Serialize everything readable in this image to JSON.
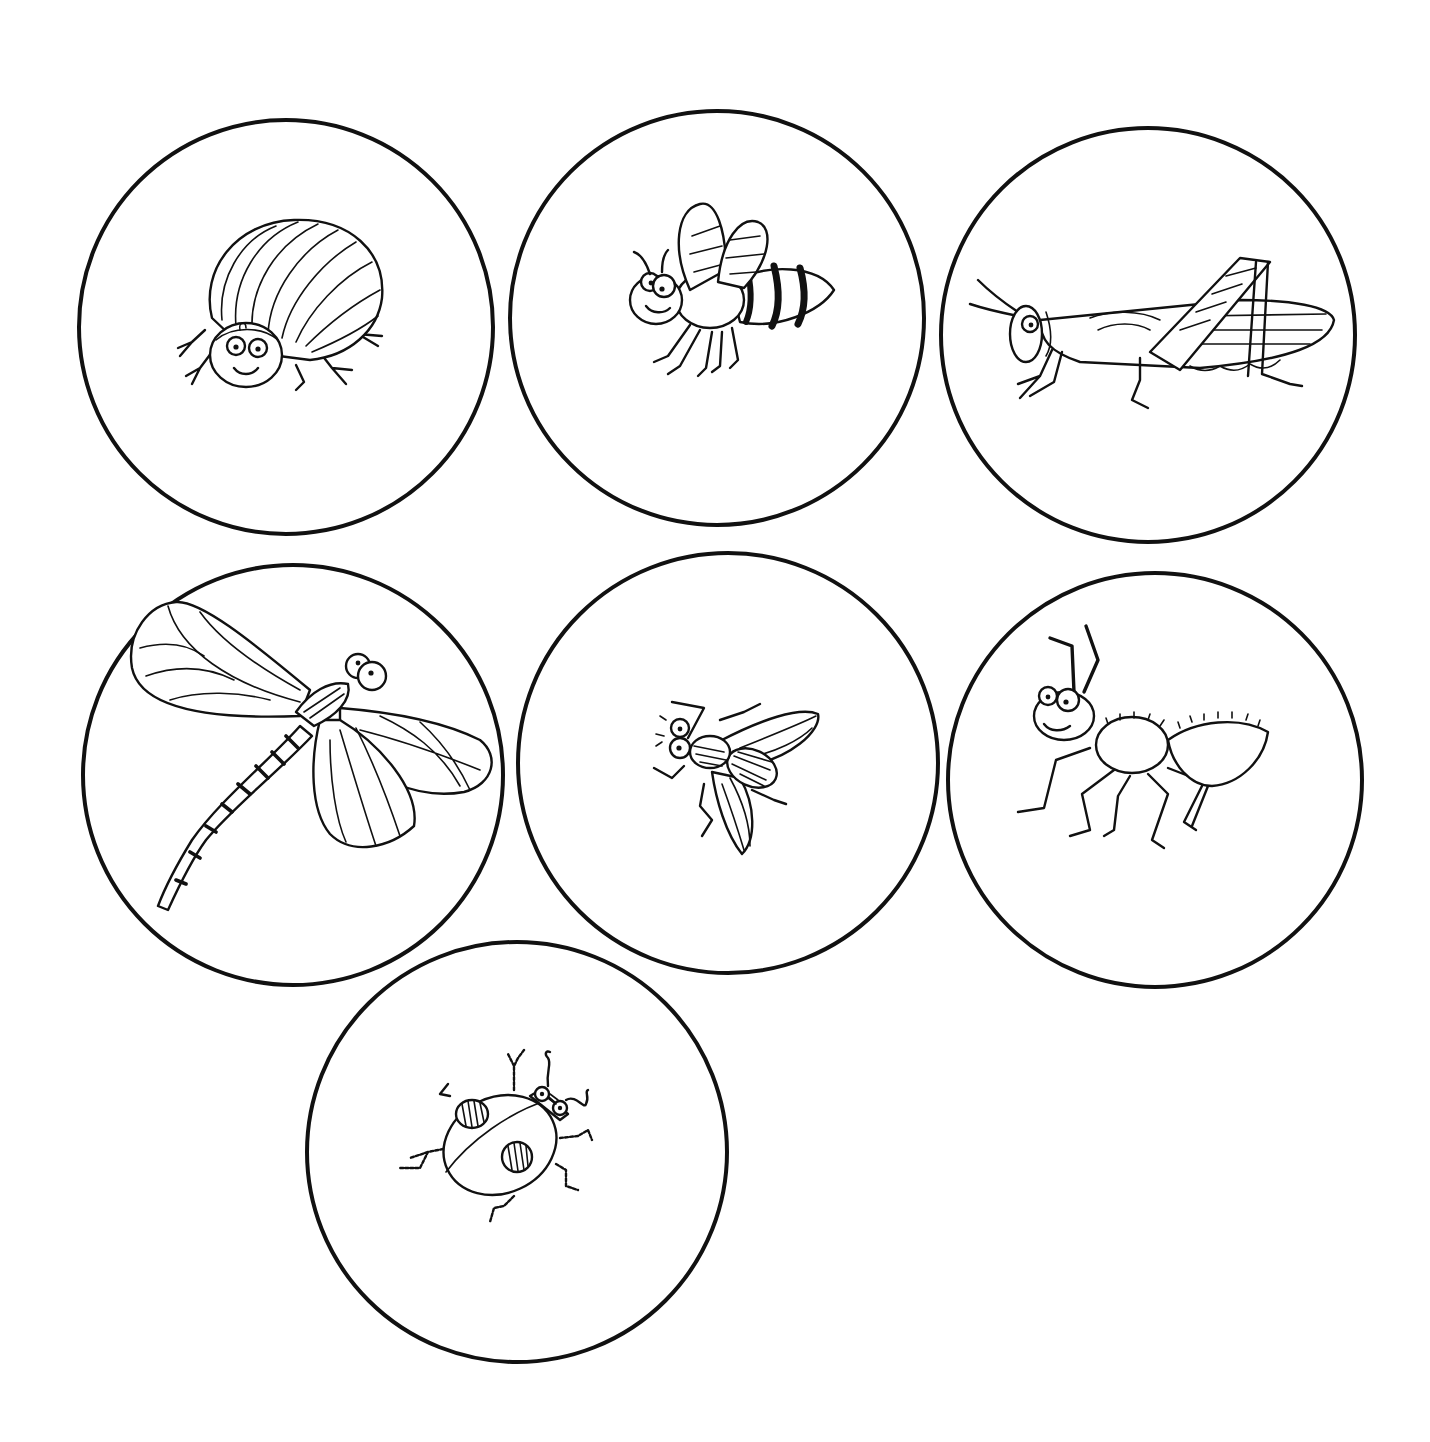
{
  "page": {
    "title": "",
    "background": "#ffffff",
    "line_color": "#111111"
  },
  "cards": [
    {
      "id": "beetle",
      "icon": "beetle-icon",
      "label": "beetle",
      "cx": 286,
      "cy": 327,
      "r": 207
    },
    {
      "id": "bee",
      "icon": "bee-icon",
      "label": "bee",
      "cx": 717,
      "cy": 318,
      "r": 207
    },
    {
      "id": "grasshopper",
      "icon": "grasshopper-icon",
      "label": "grasshopper",
      "cx": 1148,
      "cy": 335,
      "r": 207
    },
    {
      "id": "dragonfly",
      "icon": "dragonfly-icon",
      "label": "dragonfly",
      "cx": 293,
      "cy": 775,
      "r": 210
    },
    {
      "id": "fly",
      "icon": "fly-icon",
      "label": "fly",
      "cx": 728,
      "cy": 763,
      "r": 210
    },
    {
      "id": "ant",
      "icon": "ant-icon",
      "label": "ant",
      "cx": 1155,
      "cy": 780,
      "r": 207
    },
    {
      "id": "ladybug",
      "icon": "ladybug-icon",
      "label": "ladybug",
      "cx": 517,
      "cy": 1152,
      "r": 210
    }
  ]
}
